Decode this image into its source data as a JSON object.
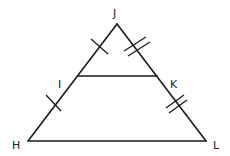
{
  "diagram": {
    "type": "triangle with midsegment",
    "labels": {
      "J": "J",
      "I": "I",
      "K": "K",
      "H": "H",
      "L": "L"
    },
    "segments": [
      "JH",
      "JL",
      "HL",
      "IK"
    ],
    "tick_marks": {
      "JI": 1,
      "IH": 1,
      "JK": 2,
      "KL": 2
    },
    "stroke_color": "#1a1a1a",
    "background": "#ffffff"
  }
}
